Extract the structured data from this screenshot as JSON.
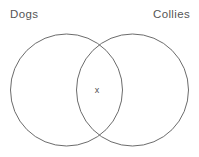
{
  "diagram": {
    "type": "venn",
    "title": "",
    "background_color": "#ffffff",
    "stroke_color": "#5a5a5a",
    "stroke_width": 0.9,
    "label_color": "#555555",
    "sets": [
      {
        "id": "dogs",
        "label": "Dogs",
        "label_position": "top-left",
        "center_x": 66.5,
        "center_y": 90,
        "radius": 56
      },
      {
        "id": "collies",
        "label": "Collies",
        "label_position": "top-right",
        "center_x": 132.5,
        "center_y": 90,
        "radius": 56
      }
    ],
    "markers": [
      {
        "id": "intersection-marker",
        "glyph": "x",
        "region": "intersection",
        "x": 97,
        "y": 90,
        "color": "#4f4f4f"
      }
    ]
  }
}
